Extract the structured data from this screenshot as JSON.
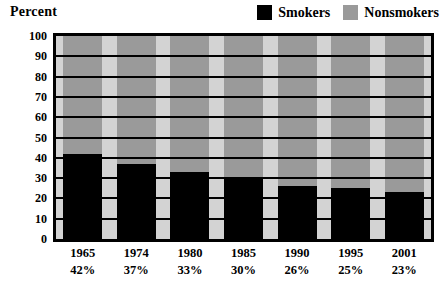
{
  "axis_title": "Percent",
  "legend": {
    "entries": [
      {
        "label": "Smokers",
        "color": "#000000",
        "icon": "legend-swatch-black"
      },
      {
        "label": "Nonsmokers",
        "color": "#9a9a9a",
        "icon": "legend-swatch-gray"
      }
    ]
  },
  "y_axis": {
    "ticks": [
      "100",
      "90",
      "80",
      "70",
      "60",
      "50",
      "40",
      "30",
      "20",
      "10",
      "0"
    ]
  },
  "x_axis": {
    "groups": [
      {
        "year": "1965",
        "pct": "42%"
      },
      {
        "year": "1974",
        "pct": "37%"
      },
      {
        "year": "1980",
        "pct": "33%"
      },
      {
        "year": "1985",
        "pct": "30%"
      },
      {
        "year": "1990",
        "pct": "26%"
      },
      {
        "year": "1995",
        "pct": "25%"
      },
      {
        "year": "2001",
        "pct": "23%"
      }
    ]
  },
  "chart_data": {
    "type": "bar",
    "subtype": "stacked-100-percent",
    "title": "",
    "xlabel": "",
    "ylabel": "Percent",
    "ylim": [
      0,
      100
    ],
    "ytick_step": 10,
    "grid": true,
    "legend_position": "top-right",
    "categories": [
      "1965",
      "1974",
      "1980",
      "1985",
      "1990",
      "1995",
      "2001"
    ],
    "series": [
      {
        "name": "Smokers",
        "color": "#000000",
        "values": [
          42,
          37,
          33,
          30,
          26,
          25,
          23
        ]
      },
      {
        "name": "Nonsmokers",
        "color": "#9a9a9a",
        "values": [
          58,
          63,
          67,
          70,
          74,
          75,
          77
        ]
      }
    ],
    "data_labels": [
      "42%",
      "37%",
      "33%",
      "30%",
      "26%",
      "25%",
      "23%"
    ],
    "plot_background": "#d3d3d3",
    "gridline_color": "#000000",
    "frame_color": "#000000"
  }
}
